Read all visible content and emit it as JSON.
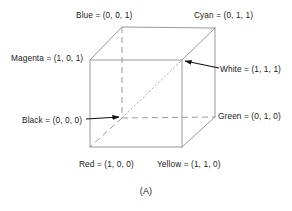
{
  "figure": {
    "caption": "(A)",
    "line_color": "#999999",
    "text_color": "#1a1a1a",
    "background": "#ffffff"
  },
  "vertices": {
    "blue": {
      "label": "Blue = (0, 0, 1)",
      "name": "Blue",
      "coords": "(0, 0, 1)"
    },
    "cyan": {
      "label": "Cyan = (0, 1, 1)",
      "name": "Cyan",
      "coords": "(0, 1, 1)"
    },
    "magenta": {
      "label": "Magenta = (1, 0, 1)",
      "name": "Magenta",
      "coords": "(1, 0, 1)"
    },
    "white": {
      "label": "White = (1, 1, 1)",
      "name": "White",
      "coords": "(1, 1, 1)"
    },
    "black": {
      "label": "Black = (0, 0, 0)",
      "name": "Black",
      "coords": "(0, 0, 0)"
    },
    "green": {
      "label": "Green = (0, 1, 0)",
      "name": "Green",
      "coords": "(0, 1, 0)"
    },
    "red": {
      "label": "Red = (1, 0, 0)",
      "name": "Red",
      "coords": "(1, 0, 0)"
    },
    "yellow": {
      "label": "Yellow = (1, 1, 0)",
      "name": "Yellow",
      "coords": "(1, 1, 0)"
    }
  }
}
